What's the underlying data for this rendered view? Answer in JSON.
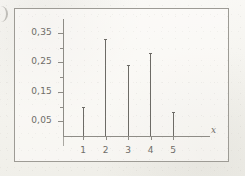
{
  "figure": {
    "kind": "spike-plot",
    "frame_border_color": "#9d9b95",
    "ink_color": "#6d6b66",
    "paper_color": "#f7f6f2"
  },
  "chart_data": {
    "type": "bar",
    "subtype": "stem-spike-plot",
    "title": "",
    "subtitle": "",
    "xlabel": "x",
    "ylabel": "",
    "categories": [
      "1",
      "2",
      "3",
      "4",
      "5"
    ],
    "x": [
      1,
      2,
      3,
      4,
      5
    ],
    "values": [
      0.1,
      0.33,
      0.24,
      0.28,
      0.08
    ],
    "xlim": [
      0,
      6
    ],
    "ylim": [
      0,
      0.4
    ],
    "grid": false,
    "legend": false,
    "legend_position": "none",
    "decimal_separator": ",",
    "y_major_ticks": [
      0.05,
      0.15,
      0.25,
      0.35
    ],
    "y_major_tick_labels": [
      "0,05",
      "0,15",
      "0,25",
      "0,35"
    ],
    "y_minor_ticks": [
      0.1,
      0.2,
      0.3,
      0.4
    ],
    "x_ticks": [
      1,
      2,
      3,
      4,
      5
    ],
    "x_tick_labels": [
      "1",
      "2",
      "3",
      "4",
      "5"
    ],
    "annotations": []
  },
  "axis": {
    "x_axis_name": "x"
  },
  "y_ticks": [
    {
      "label": "0,35",
      "value": 0.35,
      "major": true
    },
    {
      "label": "",
      "value": 0.3,
      "major": false
    },
    {
      "label": "0,25",
      "value": 0.25,
      "major": true
    },
    {
      "label": "",
      "value": 0.2,
      "major": false
    },
    {
      "label": "0,15",
      "value": 0.15,
      "major": true
    },
    {
      "label": "",
      "value": 0.1,
      "major": false
    },
    {
      "label": "0,05",
      "value": 0.05,
      "major": true
    }
  ],
  "x_items": [
    {
      "label": "1",
      "value": 0.1
    },
    {
      "label": "2",
      "value": 0.33
    },
    {
      "label": "3",
      "value": 0.24
    },
    {
      "label": "4",
      "value": 0.28
    },
    {
      "label": "5",
      "value": 0.08
    }
  ]
}
